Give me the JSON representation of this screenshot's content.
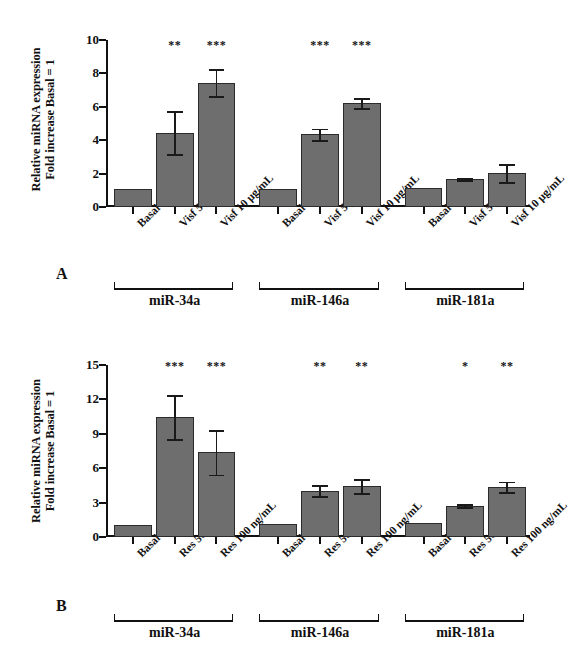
{
  "figure": {
    "panels": [
      "A",
      "B"
    ]
  },
  "chart_data": [
    {
      "type": "bar",
      "panel": "A",
      "title": "",
      "xlabel": "",
      "ylabel": "Relative miRNA expression Fold increase Basal = 1",
      "ylabel_line1": "Relative miRNA expression",
      "ylabel_line2": "Fold increase Basal = 1",
      "ylim": [
        0,
        10
      ],
      "yticks": [
        0,
        2,
        4,
        6,
        8,
        10
      ],
      "grid": false,
      "legend": "none",
      "bar_color": "#6e6e6e",
      "groups": [
        "miR-34a",
        "miR-146a",
        "miR-181a"
      ],
      "categories": [
        "Basal",
        "Visf 5 μg/mL",
        "Visf 10 μg/mL"
      ],
      "bars": [
        {
          "group": "miR-34a",
          "category": "Basal",
          "value": 1.05,
          "error": 0.0,
          "significance": ""
        },
        {
          "group": "miR-34a",
          "category": "Visf 5 μg/mL",
          "value": 4.45,
          "error": 1.3,
          "significance": "**"
        },
        {
          "group": "miR-34a",
          "category": "Visf 10 μg/mL",
          "value": 7.45,
          "error": 0.8,
          "significance": "***"
        },
        {
          "group": "miR-146a",
          "category": "Basal",
          "value": 1.1,
          "error": 0.0,
          "significance": ""
        },
        {
          "group": "miR-146a",
          "category": "Visf 5 μg/mL",
          "value": 4.35,
          "error": 0.35,
          "significance": "***"
        },
        {
          "group": "miR-146a",
          "category": "Visf 10 μg/mL",
          "value": 6.22,
          "error": 0.3,
          "significance": "***"
        },
        {
          "group": "miR-181a",
          "category": "Basal",
          "value": 1.15,
          "error": 0.0,
          "significance": ""
        },
        {
          "group": "miR-181a",
          "category": "Visf 5 μg/mL",
          "value": 1.68,
          "error": 0.05,
          "significance": ""
        },
        {
          "group": "miR-181a",
          "category": "Visf 10 μg/mL",
          "value": 2.03,
          "error": 0.55,
          "significance": ""
        }
      ]
    },
    {
      "type": "bar",
      "panel": "B",
      "title": "",
      "xlabel": "",
      "ylabel": "Relative miRNA expression Fold increase Basal = 1",
      "ylabel_line1": "Relative miRNA expression",
      "ylabel_line2": "Fold increase Basal = 1",
      "ylim": [
        0,
        15
      ],
      "yticks": [
        0,
        3,
        6,
        9,
        12,
        15
      ],
      "grid": false,
      "legend": "none",
      "bar_color": "#6e6e6e",
      "groups": [
        "miR-34a",
        "miR-146a",
        "miR-181a"
      ],
      "categories": [
        "Basal",
        "Res 50 ng/mL",
        "Res 100 ng/mL"
      ],
      "bars": [
        {
          "group": "miR-34a",
          "category": "Basal",
          "value": 1.05,
          "error": 0.0,
          "significance": ""
        },
        {
          "group": "miR-34a",
          "category": "Res 50 ng/mL",
          "value": 10.45,
          "error": 1.9,
          "significance": "***"
        },
        {
          "group": "miR-34a",
          "category": "Res 100 ng/mL",
          "value": 7.4,
          "error": 1.95,
          "significance": "***"
        },
        {
          "group": "miR-146a",
          "category": "Basal",
          "value": 1.12,
          "error": 0.0,
          "significance": ""
        },
        {
          "group": "miR-146a",
          "category": "Res 50 ng/mL",
          "value": 4.05,
          "error": 0.45,
          "significance": "**"
        },
        {
          "group": "miR-146a",
          "category": "Res 100 ng/mL",
          "value": 4.42,
          "error": 0.62,
          "significance": "**"
        },
        {
          "group": "miR-181a",
          "category": "Basal",
          "value": 1.22,
          "error": 0.0,
          "significance": ""
        },
        {
          "group": "miR-181a",
          "category": "Res 50 ng/mL",
          "value": 2.72,
          "error": 0.12,
          "significance": "*"
        },
        {
          "group": "miR-181a",
          "category": "Res 100 ng/mL",
          "value": 4.38,
          "error": 0.45,
          "significance": "**"
        }
      ]
    }
  ]
}
